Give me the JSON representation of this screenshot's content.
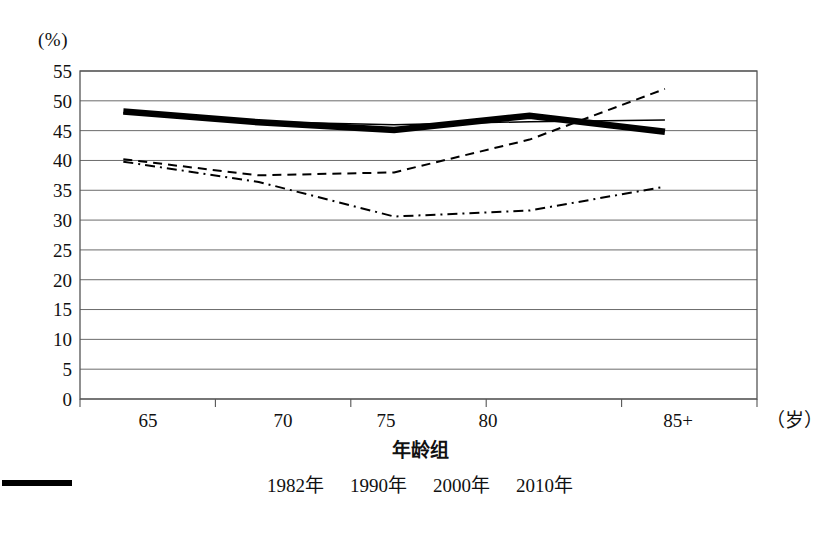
{
  "chart_data": {
    "type": "line",
    "title": "",
    "xlabel": "年龄组",
    "xunit": "（岁）",
    "ylabel": "",
    "yunit": "(%)",
    "categories": [
      "65",
      "70",
      "75",
      "80",
      "85+"
    ],
    "ylim": [
      0,
      55
    ],
    "ytick_step": 5,
    "yticks": [
      "55",
      "50",
      "45",
      "40",
      "35",
      "30",
      "25",
      "20",
      "15",
      "10",
      "5",
      "0"
    ],
    "grid": true,
    "legend_position": "bottom",
    "series": [
      {
        "name": "1982年",
        "style": "thick-solid",
        "values": [
          48.2,
          46.4,
          45.1,
          47.5,
          44.8
        ]
      },
      {
        "name": "1990年",
        "style": "thin-solid",
        "values": [
          48.0,
          46.5,
          46.0,
          46.5,
          46.8
        ]
      },
      {
        "name": "2000年",
        "style": "dashed",
        "values": [
          40.2,
          37.5,
          38.0,
          43.5,
          52.0
        ]
      },
      {
        "name": "2010年",
        "style": "dash-dot",
        "values": [
          39.8,
          36.4,
          30.6,
          31.6,
          35.6
        ]
      }
    ]
  },
  "legend": {
    "items": [
      {
        "label": "1982年"
      },
      {
        "label": "1990年"
      },
      {
        "label": "2000年"
      },
      {
        "label": "2010年"
      }
    ]
  },
  "colors": {
    "line": "#000000",
    "grid": "#6b6b6b",
    "frame": "#555555",
    "background": "#ffffff"
  }
}
